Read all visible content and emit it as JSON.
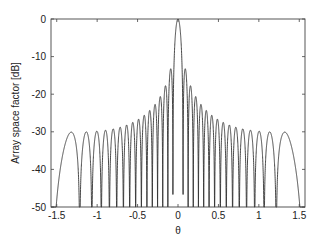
{
  "chart_data": {
    "type": "line",
    "title": "",
    "xlabel": "θ",
    "ylabel": "Array space factor [dB]",
    "xlim": [
      -1.5708,
      1.5708
    ],
    "ylim": [
      -50,
      0
    ],
    "xticks": [
      -1.5,
      -1,
      -0.5,
      0,
      0.5,
      1,
      1.5
    ],
    "xtick_labels": [
      "-1.5",
      "-1",
      "-0.5",
      "0",
      "0.5",
      "1",
      "1.5"
    ],
    "yticks": [
      0,
      -10,
      -20,
      -30,
      -40,
      -50
    ],
    "ytick_labels": [
      "0",
      "-10",
      "-20",
      "-30",
      "-40",
      "-50"
    ],
    "grid": false,
    "legend": null,
    "series": [
      {
        "name": "Array space factor",
        "description": "Uniform linear array, 20·log10|sin(Nψ/2)/(N·sin(ψ/2))|, ψ = 2π(d/λ)·sin θ",
        "model": {
          "elements": 32,
          "spacing_wavelengths": 0.5
        },
        "mainlobe_peak": {
          "theta": 0,
          "db": 0
        },
        "first_sidelobe_db": -13.3,
        "edge_sidelobe": {
          "theta": 1.32,
          "db": -30.1
        },
        "sidelobe_peaks": [
          {
            "theta": -1.32,
            "db": -30.1
          },
          {
            "theta": -1.12,
            "db": -30.0
          },
          {
            "theta": -0.99,
            "db": -29.8
          },
          {
            "theta": -0.88,
            "db": -29.5
          },
          {
            "theta": -0.78,
            "db": -29.1
          },
          {
            "theta": -0.69,
            "db": -28.6
          },
          {
            "theta": -0.61,
            "db": -28.0
          },
          {
            "theta": -0.53,
            "db": -27.2
          },
          {
            "theta": -0.45,
            "db": -26.2
          },
          {
            "theta": -0.38,
            "db": -24.9
          },
          {
            "theta": -0.31,
            "db": -23.4
          },
          {
            "theta": -0.24,
            "db": -21.3
          },
          {
            "theta": -0.17,
            "db": -18.4
          },
          {
            "theta": -0.1,
            "db": -13.3
          },
          {
            "theta": 0.1,
            "db": -13.3
          },
          {
            "theta": 0.17,
            "db": -18.4
          },
          {
            "theta": 0.24,
            "db": -21.3
          },
          {
            "theta": 0.31,
            "db": -23.4
          },
          {
            "theta": 0.38,
            "db": -24.9
          },
          {
            "theta": 0.45,
            "db": -26.2
          },
          {
            "theta": 0.53,
            "db": -27.2
          },
          {
            "theta": 0.61,
            "db": -28.0
          },
          {
            "theta": 0.69,
            "db": -28.6
          },
          {
            "theta": 0.78,
            "db": -29.1
          },
          {
            "theta": 0.88,
            "db": -29.5
          },
          {
            "theta": 0.99,
            "db": -29.8
          },
          {
            "theta": 1.12,
            "db": -30.0
          },
          {
            "theta": 1.32,
            "db": -30.1
          }
        ],
        "clipped_below_db": -50
      }
    ]
  }
}
